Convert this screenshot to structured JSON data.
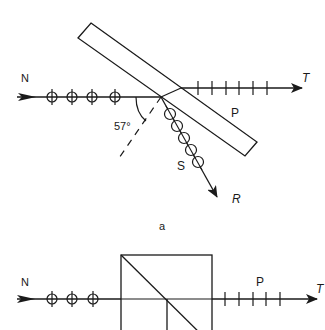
{
  "figure": {
    "type": "optics diagram: polarization by reflection at Brewster angle and polarizing beam-splitter cube",
    "colors": {
      "ink": "#1a1a1a",
      "background": "#ffffff"
    }
  },
  "panel_a": {
    "caption": "a",
    "incident_label": "N",
    "transmitted_label": "T",
    "reflected_label": "R",
    "p_label": "P",
    "s_label": "S",
    "angle_label": "57°",
    "incident_markers": 4,
    "transmitted_ticks": 7,
    "reflected_markers": 5
  },
  "panel_b": {
    "incident_label": "N",
    "transmitted_label": "T",
    "p_label": "P",
    "incident_markers": 3,
    "transmitted_ticks": 5
  }
}
